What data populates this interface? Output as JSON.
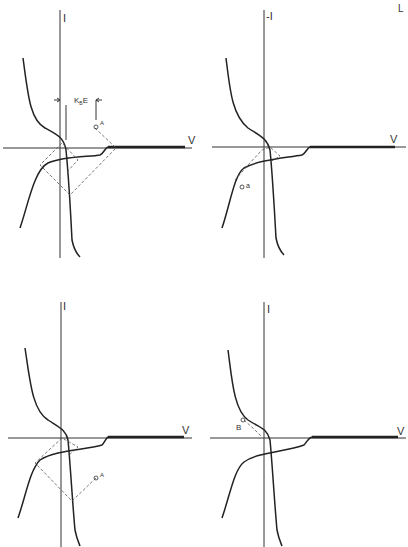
{
  "corner_mark": "L",
  "panels": [
    {
      "id": "top-left",
      "y_label": "I",
      "x_label": "V",
      "point_label": "A",
      "dimension_label": "K",
      "dimension_sub": "B",
      "dimension_suffix": "E"
    },
    {
      "id": "top-right",
      "y_label": "-I",
      "x_label": "V",
      "point_label": "a"
    },
    {
      "id": "bottom-left",
      "y_label": "I",
      "x_label": "V",
      "point_label": "A"
    },
    {
      "id": "bottom-right",
      "y_label": "I",
      "x_label": "V",
      "point_label": "B"
    }
  ]
}
